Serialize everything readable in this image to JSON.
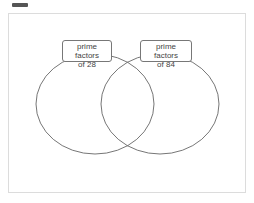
{
  "toolbar": {
    "icon": "minus-bar-icon"
  },
  "diagram": {
    "type": "venn",
    "sets": [
      {
        "label_line1": "prime factors",
        "label_line2": "of 28"
      },
      {
        "label_line1": "prime factors",
        "label_line2": "of 84"
      }
    ],
    "colors": {
      "stroke": "#666666",
      "frame": "#dcdcdc",
      "label_border": "#777777"
    }
  }
}
